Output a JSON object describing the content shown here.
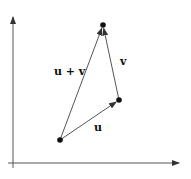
{
  "diagram": {
    "title": "",
    "type": "vector-addition",
    "colors": {
      "axis": "#555555",
      "vector": "#555555",
      "point": "#111111",
      "label": "#111111",
      "background": "#ffffff"
    },
    "axes": {
      "x": {
        "from": [
          8,
          163
        ],
        "to": [
          179,
          163
        ]
      },
      "y": {
        "from": [
          13,
          168
        ],
        "to": [
          13,
          17
        ]
      }
    },
    "points": [
      {
        "id": "origin",
        "x": 60,
        "y": 140
      },
      {
        "id": "u-tip",
        "x": 119,
        "y": 100
      },
      {
        "id": "sum-tip",
        "x": 103,
        "y": 25
      }
    ],
    "vectors": [
      {
        "id": "u",
        "label": "u",
        "from": [
          60,
          140
        ],
        "to": [
          119,
          100
        ],
        "label_pos": [
          94,
          131
        ]
      },
      {
        "id": "v",
        "label": "v",
        "from": [
          119,
          100
        ],
        "to": [
          103,
          25
        ],
        "label_pos": [
          120,
          65
        ]
      },
      {
        "id": "u_plus_v",
        "label": "u + v",
        "from": [
          60,
          140
        ],
        "to": [
          103,
          25
        ],
        "label_pos": [
          54,
          75
        ]
      }
    ]
  }
}
